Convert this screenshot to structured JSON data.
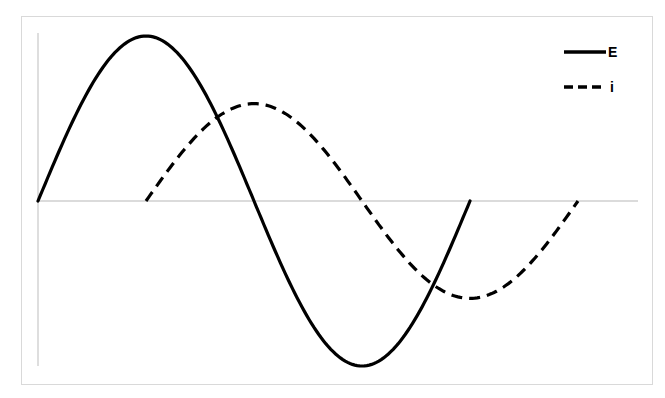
{
  "chart_data": {
    "type": "line",
    "title": "",
    "xlabel": "",
    "ylabel": "",
    "grid": false,
    "legend_position": "top-right",
    "x_unit": "phase (degrees)",
    "xlim": [
      0,
      540
    ],
    "ylim": [
      -1,
      1
    ],
    "series": [
      {
        "name": "E",
        "style": "solid",
        "color": "#000000",
        "amplitude": 1.0,
        "phase_shift_deg": 0,
        "x": [
          0,
          45,
          90,
          135,
          180,
          225,
          270,
          315,
          360
        ],
        "values": [
          0,
          0.71,
          1.0,
          0.71,
          0,
          -0.71,
          -1.0,
          -0.71,
          0
        ]
      },
      {
        "name": "i",
        "style": "dashed",
        "color": "#000000",
        "amplitude": 0.59,
        "phase_shift_deg": 90,
        "x": [
          90,
          135,
          180,
          225,
          270,
          315,
          360,
          405,
          450
        ],
        "values": [
          0,
          0.42,
          0.59,
          0.42,
          0,
          -0.42,
          -0.59,
          -0.42,
          0
        ]
      }
    ]
  },
  "legend": {
    "items": [
      {
        "label": "E",
        "style": "solid"
      },
      {
        "label": "i",
        "style": "dashed"
      }
    ]
  }
}
